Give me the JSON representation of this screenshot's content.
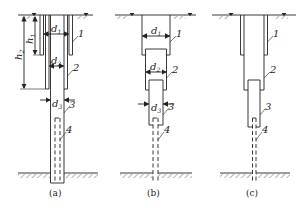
{
  "figure": {
    "type": "engineering-diagram",
    "panels": [
      {
        "id": "a",
        "caption": "(a)",
        "dimensions": {
          "d1": "d",
          "d1_sub": "1",
          "d2": "d",
          "d2_sub": "2",
          "d3": "d",
          "d3_sub": "3",
          "h1": "h",
          "h1_sub": "1",
          "h2": "h",
          "h2_sub": "2"
        },
        "parts": [
          "1",
          "2",
          "3",
          "4"
        ]
      },
      {
        "id": "b",
        "caption": "(b)",
        "dimensions": {
          "d1": "d",
          "d1_sub": "1",
          "d2": "d",
          "d2_sub": "2",
          "d3": "d",
          "d3_sub": "3"
        },
        "parts": [
          "1",
          "2",
          "3",
          "4"
        ]
      },
      {
        "id": "c",
        "caption": "(c)",
        "parts": [
          "1",
          "2",
          "3",
          "4"
        ]
      }
    ],
    "colors": {
      "line": "#222222",
      "background": "#ffffff"
    }
  }
}
